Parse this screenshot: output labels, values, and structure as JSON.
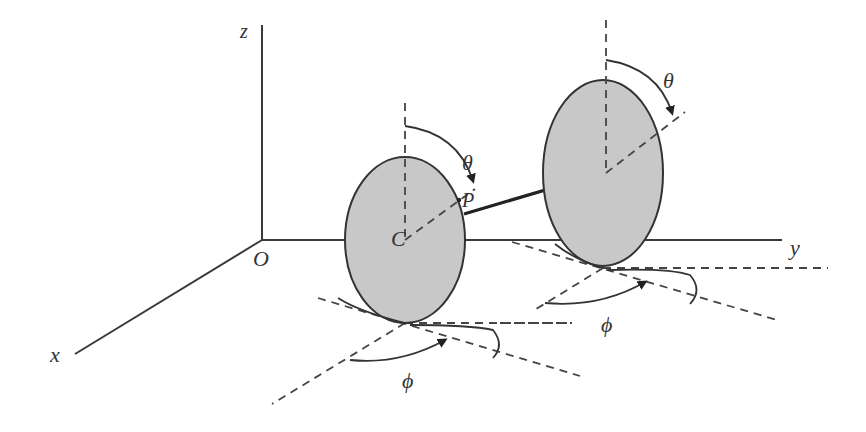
{
  "diagram": {
    "colors": {
      "background": "#ffffff",
      "wheel_fill": "#c8c8c8",
      "stroke": "#333333"
    },
    "axes": {
      "origin_label": "O",
      "x_label": "x",
      "y_label": "y",
      "z_label": "z"
    },
    "left_wheel": {
      "center_label": "C",
      "point_label": "P",
      "rotation_angle_label": "θ",
      "heading_angle_label": "ϕ"
    },
    "right_wheel": {
      "rotation_angle_label": "θ",
      "heading_angle_label": "ϕ"
    }
  }
}
